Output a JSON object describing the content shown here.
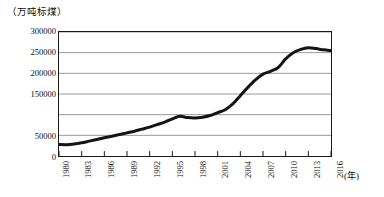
{
  "chart_data": {
    "type": "line",
    "title": "",
    "subtitle": "",
    "xlabel": "(年)",
    "ylabel": "（万吨标煤）",
    "unit_caption": "（万吨标煤）",
    "x_axis_caption": "(年)",
    "xlim": [
      1980,
      2016
    ],
    "ylim": [
      0,
      300000
    ],
    "grid": true,
    "legend": "none",
    "y_ticks": [
      0,
      50000,
      150000,
      200000,
      250000,
      300000
    ],
    "y_tick_labels": [
      "0",
      "50000",
      "150000",
      "200000",
      "250000",
      "300000"
    ],
    "y_gridlines": [
      0,
      50000,
      100000,
      150000,
      200000,
      250000,
      300000
    ],
    "x_ticks": [
      1980,
      1983,
      1986,
      1989,
      1992,
      1995,
      1998,
      2001,
      2004,
      2007,
      2010,
      2013,
      2016
    ],
    "x_tick_labels": [
      "1980",
      "1983",
      "1986",
      "1989",
      "1992",
      "1995",
      "1998",
      "2001",
      "2004",
      "2007",
      "2010",
      "2013",
      "2016"
    ],
    "series": [
      {
        "name": "能源消费总量",
        "color": "#141414",
        "x": [
          1980,
          1981,
          1982,
          1983,
          1984,
          1985,
          1986,
          1987,
          1988,
          1989,
          1990,
          1991,
          1992,
          1993,
          1994,
          1995,
          1996,
          1997,
          1998,
          1999,
          2000,
          2001,
          2002,
          2003,
          2004,
          2005,
          2006,
          2007,
          2008,
          2009,
          2010,
          2011,
          2012,
          2013,
          2014,
          2015,
          2016
        ],
        "values": [
          28000,
          27500,
          29000,
          32000,
          36000,
          40000,
          44000,
          48000,
          52000,
          56000,
          60000,
          65000,
          70000,
          76000,
          82000,
          90000,
          96000,
          93000,
          92000,
          94000,
          98000,
          105000,
          112000,
          126000,
          146000,
          166000,
          184000,
          198000,
          205000,
          214000,
          235000,
          250000,
          258000,
          262000,
          260000,
          257000,
          255000
        ],
        "values_scaled_note": "读数单位：万吨标煤"
      }
    ],
    "annotations": []
  },
  "figure": {
    "plot_background": "#ffffff",
    "frame_color": "#1a1a1a",
    "gridline_color": "#9a9a9a",
    "line_color": "#141414",
    "line_width": 3
  }
}
